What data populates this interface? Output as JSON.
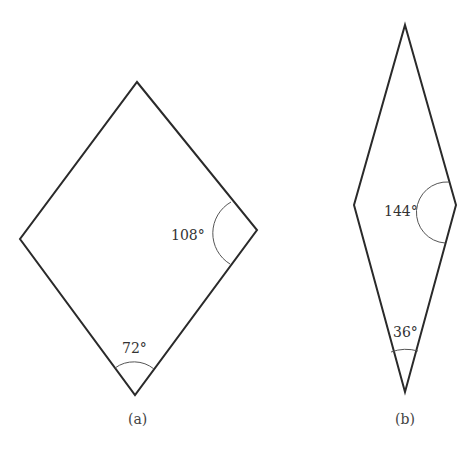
{
  "figures": [
    {
      "id": "a",
      "caption": "(a)",
      "shape": "rhombus",
      "angles": [
        {
          "vertex": "right",
          "label": "108°",
          "degrees": 108
        },
        {
          "vertex": "bottom",
          "label": "72°",
          "degrees": 72
        }
      ]
    },
    {
      "id": "b",
      "caption": "(b)",
      "shape": "rhombus",
      "angles": [
        {
          "vertex": "right",
          "label": "144°",
          "degrees": 144
        },
        {
          "vertex": "bottom",
          "label": "36°",
          "degrees": 36
        }
      ]
    }
  ]
}
